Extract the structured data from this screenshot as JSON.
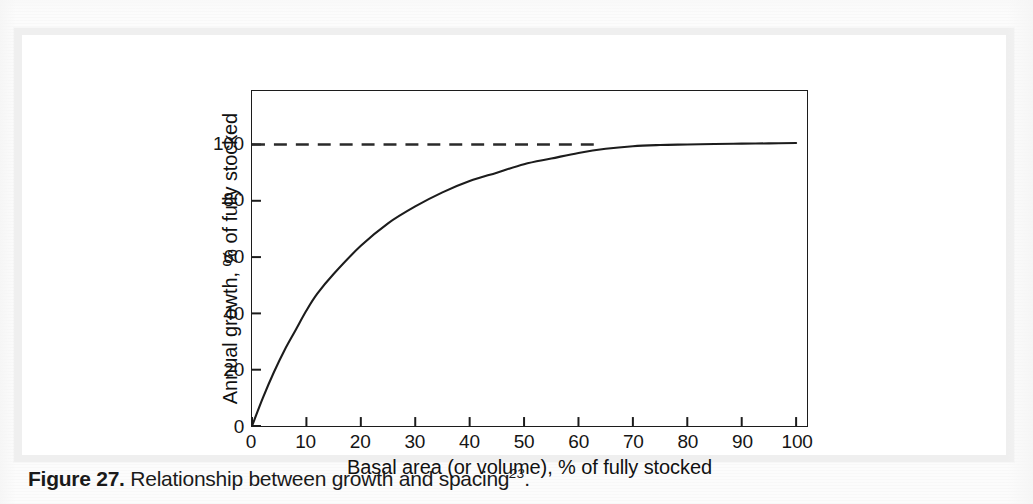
{
  "figure": {
    "caption_label": "Figure 27.",
    "caption_text": " Relationship between growth and spacing",
    "caption_superscript": "23",
    "caption_end": "."
  },
  "chart_data": {
    "type": "line",
    "title": "",
    "xlabel": "Basal area (or volume), % of fully stocked",
    "ylabel": "Annual growth, % of fully stocked",
    "xlim": [
      0,
      102
    ],
    "ylim": [
      0,
      119
    ],
    "xticks": [
      0,
      10,
      20,
      30,
      40,
      50,
      60,
      70,
      80,
      90,
      100
    ],
    "xticklabels": [
      "0",
      "10",
      "20",
      "30",
      "40",
      "50",
      "60",
      "70",
      "80",
      "90",
      "100"
    ],
    "yticks": [
      0,
      20,
      40,
      60,
      80,
      100
    ],
    "yticklabels": [
      "0",
      "20",
      "40",
      "60",
      "80",
      "100"
    ],
    "grid": false,
    "legend": false,
    "frame": "box",
    "series": [
      {
        "name": "Annual growth response",
        "style": "solid",
        "color": "#1c1c1c",
        "x": [
          0,
          2,
          4,
          6,
          8,
          10,
          12,
          15,
          20,
          25,
          30,
          35,
          40,
          45,
          50,
          55,
          60,
          65,
          70,
          75,
          80,
          85,
          90,
          95,
          100
        ],
        "y": [
          0,
          10,
          19,
          27,
          34,
          41,
          47,
          54,
          64,
          72,
          78,
          83,
          87,
          90,
          93,
          95,
          97,
          98.5,
          99.4,
          99.8,
          100,
          100.2,
          100.3,
          100.4,
          100.5
        ]
      },
      {
        "name": "Fully stocked reference",
        "style": "dashed",
        "color": "#2a2a2a",
        "x": [
          0,
          64
        ],
        "y": [
          100,
          100
        ]
      }
    ],
    "annotations": []
  },
  "yticks_render": [
    {
      "label": "100",
      "value": 100
    },
    {
      "label": "80",
      "value": 80
    },
    {
      "label": "60",
      "value": 60
    },
    {
      "label": "40",
      "value": 40
    },
    {
      "label": "20",
      "value": 20
    },
    {
      "label": "0",
      "value": 0
    }
  ]
}
